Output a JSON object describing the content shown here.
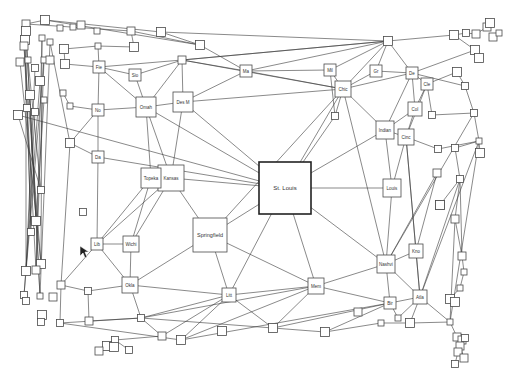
{
  "diagram": {
    "type": "network-graph",
    "background": "#ffffff",
    "node_stroke": "#4a4a4a",
    "edge_color": "#3a3a3a",
    "labeled_nodes": [
      {
        "id": "stlouis",
        "label": "St. Louis",
        "x": 285,
        "y": 188,
        "w": 52,
        "h": 52,
        "hub": true
      },
      {
        "id": "springfield",
        "label": "Springfield",
        "x": 210,
        "y": 235,
        "w": 34,
        "h": 34
      },
      {
        "id": "kansas",
        "label": "Kansas",
        "x": 171,
        "y": 178,
        "w": 26,
        "h": 26
      },
      {
        "id": "topeka",
        "label": "Topeka",
        "x": 151,
        "y": 178,
        "w": 20,
        "h": 20
      },
      {
        "id": "omah",
        "label": "Omah",
        "x": 146,
        "y": 107,
        "w": 20,
        "h": 20
      },
      {
        "id": "desm",
        "label": "Des M",
        "x": 183,
        "y": 102,
        "w": 20,
        "h": 20
      },
      {
        "id": "sio",
        "label": "Sio",
        "x": 135,
        "y": 75,
        "w": 12,
        "h": 12
      },
      {
        "id": "fie",
        "label": "Fie",
        "x": 99,
        "y": 67,
        "w": 12,
        "h": 12
      },
      {
        "id": "no",
        "label": "No",
        "x": 98,
        "y": 110,
        "w": 12,
        "h": 12
      },
      {
        "id": "da",
        "label": "Da",
        "x": 98,
        "y": 157,
        "w": 12,
        "h": 12
      },
      {
        "id": "lib",
        "label": "Lib",
        "x": 97,
        "y": 244,
        "w": 12,
        "h": 12
      },
      {
        "id": "wichi",
        "label": "Wichi",
        "x": 131,
        "y": 244,
        "w": 16,
        "h": 16
      },
      {
        "id": "okla",
        "label": "Okla",
        "x": 130,
        "y": 285,
        "w": 16,
        "h": 16
      },
      {
        "id": "litt",
        "label": "Litt",
        "x": 229,
        "y": 295,
        "w": 14,
        "h": 14
      },
      {
        "id": "mem",
        "label": "Mem",
        "x": 316,
        "y": 286,
        "w": 16,
        "h": 16
      },
      {
        "id": "nashvi",
        "label": "Nashvi",
        "x": 386,
        "y": 264,
        "w": 18,
        "h": 18
      },
      {
        "id": "kno",
        "label": "Kno",
        "x": 416,
        "y": 251,
        "w": 14,
        "h": 14
      },
      {
        "id": "atla",
        "label": "Atla",
        "x": 420,
        "y": 297,
        "w": 14,
        "h": 14
      },
      {
        "id": "bir",
        "label": "Bir",
        "x": 390,
        "y": 303,
        "w": 12,
        "h": 12
      },
      {
        "id": "louis",
        "label": "Louis",
        "x": 392,
        "y": 188,
        "w": 18,
        "h": 18
      },
      {
        "id": "indian",
        "label": "Indian",
        "x": 385,
        "y": 130,
        "w": 18,
        "h": 18
      },
      {
        "id": "cinc",
        "label": "Cinc",
        "x": 406,
        "y": 137,
        "w": 16,
        "h": 16
      },
      {
        "id": "col",
        "label": "Col",
        "x": 415,
        "y": 109,
        "w": 14,
        "h": 14
      },
      {
        "id": "cle",
        "label": "Cle",
        "x": 427,
        "y": 84,
        "w": 12,
        "h": 12
      },
      {
        "id": "de",
        "label": "De",
        "x": 412,
        "y": 73,
        "w": 12,
        "h": 12
      },
      {
        "id": "gr",
        "label": "Gr",
        "x": 376,
        "y": 71,
        "w": 12,
        "h": 12
      },
      {
        "id": "mil",
        "label": "Mil",
        "x": 330,
        "y": 70,
        "w": 12,
        "h": 12
      },
      {
        "id": "chic",
        "label": "Chic",
        "x": 343,
        "y": 89,
        "w": 16,
        "h": 16
      },
      {
        "id": "ma",
        "label": "Ma",
        "x": 246,
        "y": 71,
        "w": 12,
        "h": 12
      }
    ],
    "unlabeled_node_count": 84
  }
}
